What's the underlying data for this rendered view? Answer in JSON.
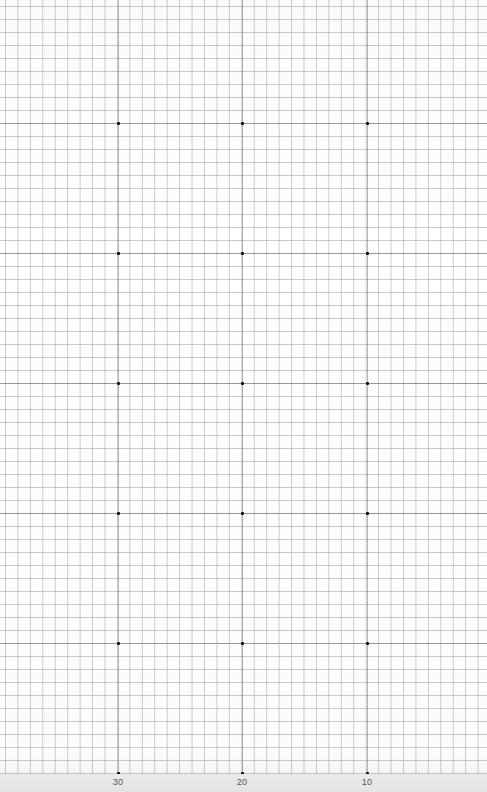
{
  "sheet": {
    "type": "graph-paper",
    "grid": {
      "cell_width_px": 12.45,
      "cell_height_px": 13,
      "line_color": "#9a9a9a",
      "background_color": "#ffffff"
    },
    "dot_columns_x": [
      118,
      242,
      367
    ],
    "dot_rows_y": [
      123,
      253,
      383,
      513,
      643,
      773
    ],
    "bottom_labels": [
      {
        "text": "30",
        "x": 118
      },
      {
        "text": "20",
        "x": 242
      },
      {
        "text": "10",
        "x": 367
      }
    ]
  }
}
